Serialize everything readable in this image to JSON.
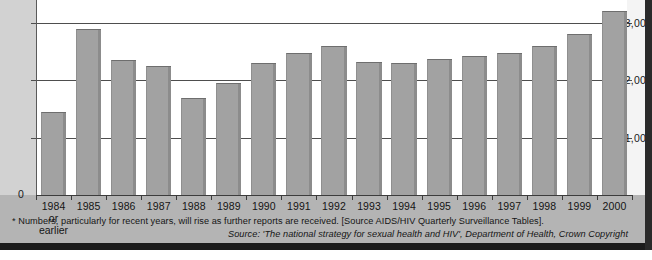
{
  "chart_data": {
    "type": "bar",
    "title": "",
    "xlabel": "",
    "ylabel": "",
    "grid": true,
    "legend": "none",
    "ylim": [
      0,
      3400
    ],
    "yticks": [
      0,
      1000,
      2000,
      3000
    ],
    "ytick_labels": [
      "0",
      "1,000",
      "2,000",
      "3,000"
    ],
    "categories": [
      "1984",
      "1985",
      "1986",
      "1987",
      "1988",
      "1989",
      "1990",
      "1991",
      "1992",
      "1993",
      "1994",
      "1995",
      "1996",
      "1997",
      "1998",
      "1999",
      "2000"
    ],
    "category_sublabels": {
      "1984": "or earlier"
    },
    "values": [
      1450,
      2900,
      2350,
      2250,
      1700,
      1950,
      2300,
      2470,
      2600,
      2320,
      2300,
      2380,
      2430,
      2470,
      2600,
      2800,
      3200
    ],
    "series": [
      {
        "name": "Reported cases",
        "values": [
          1450,
          2900,
          2350,
          2250,
          1700,
          1950,
          2300,
          2470,
          2600,
          2320,
          2300,
          2380,
          2430,
          2470,
          2600,
          2800,
          3200
        ]
      }
    ]
  },
  "colors": {
    "bar_fill": "#a2a2a2",
    "bar_shade": "#8c8c8c",
    "plot_background": "#ffffff",
    "plate_background": "#b4b4b4",
    "axis_strip": "#d2d2d2",
    "gridline": "#4e4e4e",
    "text": "#141414"
  },
  "notes": {
    "footnote": "* Numbers, particularly for recent years, will rise as further reports are received. [Source AIDS/HIV Quarterly Surveillance Tables].",
    "source": "Source: 'The national strategy for sexual health and HIV', Department of Health, Crown Copyright"
  }
}
